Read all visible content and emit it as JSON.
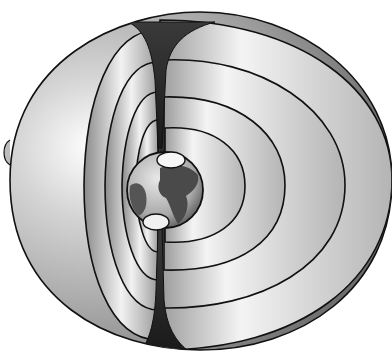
{
  "image": {
    "subject": "magnetosphere-illustration",
    "width": 392,
    "height": 356,
    "background": "#ffffff",
    "colors": {
      "outline": "#111111",
      "shell_light": "#f2f2f2",
      "shell_mid": "#b8b8b8",
      "shell_dark": "#6a6a6a",
      "cusp_dark": "#2a2a2a",
      "ocean": "#d8d8d8",
      "land": "#4a4a4a",
      "polar_cap": "#f6f6f6"
    },
    "elements": [
      "outer-magnetopause-shell",
      "field-line-loops-left",
      "field-line-loops-right",
      "polar-cusp-top",
      "polar-cusp-bottom",
      "earth-globe",
      "north-polar-cap",
      "south-polar-cap"
    ]
  }
}
